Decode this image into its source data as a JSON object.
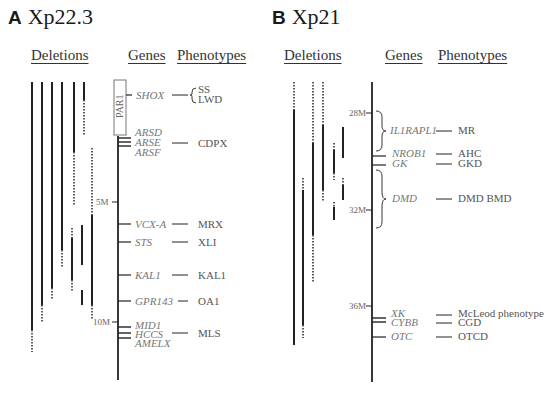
{
  "panels": [
    {
      "letter": "A",
      "region": "Xp22.3",
      "headers": {
        "deletions": "Deletions",
        "genes": "Genes",
        "phenotypes": "Phenotypes"
      },
      "scale_ticks": [
        {
          "label": "5M",
          "y": 202
        },
        {
          "label": "10M",
          "y": 322
        }
      ],
      "region_box": {
        "label": "PAR1"
      },
      "genes": [
        {
          "name": "SHOX",
          "phenotype": "SS LWD"
        },
        {
          "name": "ARSD",
          "phenotype": ""
        },
        {
          "name": "ARSE",
          "phenotype": "CDPX"
        },
        {
          "name": "ARSF",
          "phenotype": ""
        },
        {
          "name": "VCX-A",
          "phenotype": "MRX"
        },
        {
          "name": "STS",
          "phenotype": "XLI"
        },
        {
          "name": "KAL1",
          "phenotype": "KAL1"
        },
        {
          "name": "GPR143",
          "phenotype": "OA1"
        },
        {
          "name": "MID1",
          "phenotype": ""
        },
        {
          "name": "HCCS",
          "phenotype": "MLS"
        },
        {
          "name": "AMELX",
          "phenotype": ""
        }
      ],
      "phenotype_labels": {
        "ss": "SS",
        "lwd": "LWD",
        "cdpx": "CDPX",
        "mrx": "MRX",
        "xli": "XLI",
        "kal1": "KAL1",
        "oa1": "OA1",
        "mls": "MLS"
      }
    },
    {
      "letter": "B",
      "region": "Xp21",
      "headers": {
        "deletions": "Deletions",
        "genes": "Genes",
        "phenotypes": "Phenotypes"
      },
      "scale_ticks": [
        {
          "label": "28M",
          "y": 113
        },
        {
          "label": "32M",
          "y": 210
        },
        {
          "label": "36M",
          "y": 306
        }
      ],
      "genes": [
        {
          "name": "IL1RAPL1",
          "phenotype": "MR"
        },
        {
          "name": "NROB1",
          "phenotype": "AHC"
        },
        {
          "name": "GK",
          "phenotype": "GKD"
        },
        {
          "name": "DMD",
          "phenotype": "DMD BMD"
        },
        {
          "name": "XK",
          "phenotype": "McLeod phenotype"
        },
        {
          "name": "CYBB",
          "phenotype": "CGD"
        },
        {
          "name": "OTC",
          "phenotype": "OTCD"
        }
      ]
    }
  ]
}
